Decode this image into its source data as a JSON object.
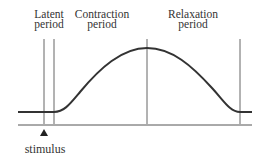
{
  "diagram": {
    "phases": [
      {
        "label": "Latent",
        "label2": "period"
      },
      {
        "label": "Contraction",
        "label2": "period"
      },
      {
        "label": "Relaxation",
        "label2": "period"
      }
    ],
    "stimulus_label": "stimulus",
    "colors": {
      "curve": "#333333",
      "lines": "#555555",
      "baseline": "#555555",
      "text": "#333333"
    }
  }
}
